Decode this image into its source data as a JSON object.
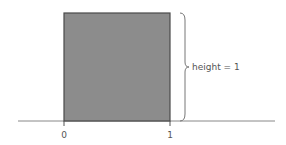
{
  "diagram": {
    "shape": "unit-square",
    "fill_color": "#8c8c8c",
    "stroke_color": "#4a4a4a",
    "axis_color": "#888888",
    "brace_color": "#777777",
    "height_label": "height = 1",
    "x_ticks": [
      {
        "label": "0"
      },
      {
        "label": "1"
      }
    ]
  }
}
